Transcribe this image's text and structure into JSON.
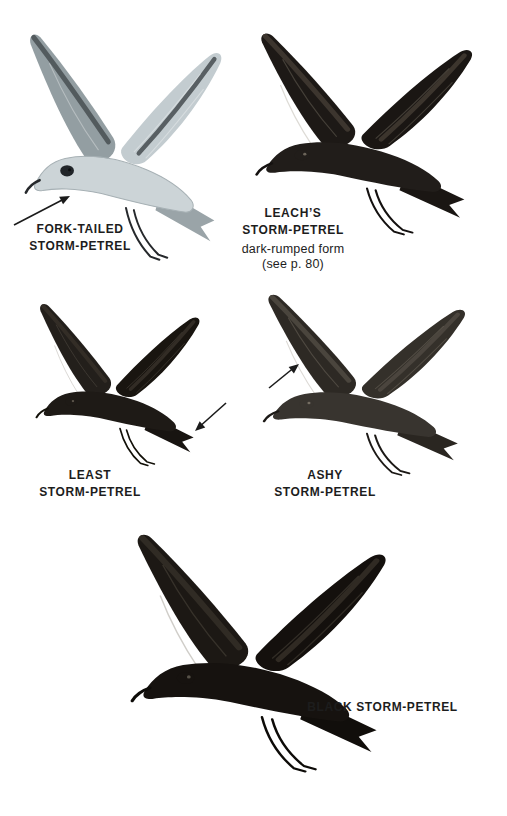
{
  "birds": [
    {
      "id": "fork-tailed-storm-petrel",
      "label": [
        "FORK-TAILED",
        "STORM-PETREL"
      ],
      "plumage": "pale gray",
      "has_pointer_arrow": true
    },
    {
      "id": "leachs-storm-petrel",
      "label": [
        "LEACH’S",
        "STORM-PETREL"
      ],
      "note": [
        "dark-rumped form",
        "(see p. 80)"
      ],
      "plumage": "blackish brown",
      "has_pointer_arrow": false
    },
    {
      "id": "least-storm-petrel",
      "label": [
        "LEAST",
        "STORM-PETREL"
      ],
      "plumage": "blackish",
      "has_pointer_arrow": true
    },
    {
      "id": "ashy-storm-petrel",
      "label": [
        "ASHY",
        "STORM-PETREL"
      ],
      "plumage": "dark ashy gray",
      "has_pointer_arrow": true
    },
    {
      "id": "black-storm-petrel",
      "label": [
        "BLACK STORM-PETREL"
      ],
      "plumage": "black",
      "has_pointer_arrow": false
    }
  ],
  "colors": {
    "background": "#ffffff",
    "text": "#1d1d1d",
    "arrow": "#1b1b1b",
    "fork_tailed_body": "#ccd4d7",
    "fork_tailed_wing": "#939ea2",
    "dark_plumage": "#1d1916",
    "ashy_plumage": "#38342f",
    "black_plumage": "#16120f"
  }
}
